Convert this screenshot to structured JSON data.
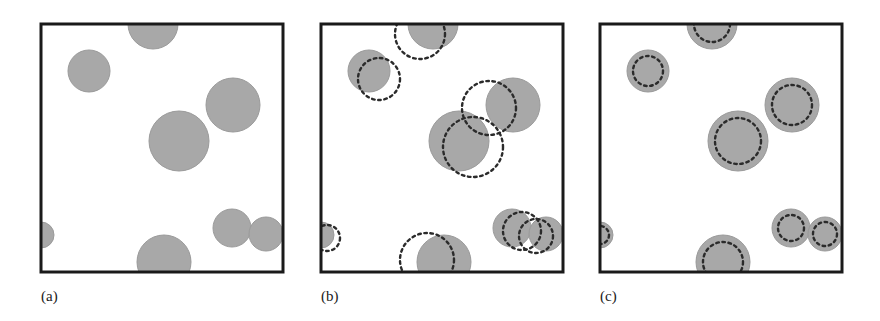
{
  "figure": {
    "width": 880,
    "height": 321,
    "background": "#ffffff",
    "panel_count": 3
  },
  "style": {
    "disk_fill": "#a8a8a8",
    "disk_stroke": "#9a9a9a",
    "box_stroke": "#1a1a1a",
    "box_stroke_width": 3,
    "dash_stroke": "#2b2b2b",
    "dash_stroke_width": 2.4,
    "dash_pattern": "2.6 3.6",
    "label_color": "#1a1a1a"
  },
  "panels": [
    {
      "id": "a",
      "label": "(a)",
      "label_x": 41,
      "label_y": 301,
      "box": {
        "x": 41,
        "y": 24,
        "w": 242,
        "h": 248
      },
      "has_dashed": false,
      "dash_mode": "none",
      "disks": [
        {
          "cx": 89,
          "cy": 71,
          "r": 21
        },
        {
          "cx": 153,
          "cy": 24,
          "r": 25
        },
        {
          "cx": 233,
          "cy": 105,
          "r": 27
        },
        {
          "cx": 179,
          "cy": 141,
          "r": 30
        },
        {
          "cx": 41,
          "cy": 235,
          "r": 13
        },
        {
          "cx": 232,
          "cy": 228,
          "r": 19
        },
        {
          "cx": 266,
          "cy": 234,
          "r": 17
        },
        {
          "cx": 164,
          "cy": 262,
          "r": 27
        }
      ]
    },
    {
      "id": "b",
      "label": "(b)",
      "label_x": 321,
      "label_y": 301,
      "box": {
        "x": 321,
        "y": 24,
        "w": 242,
        "h": 248
      },
      "has_dashed": true,
      "dash_mode": "offset",
      "disks": [
        {
          "cx": 369,
          "cy": 71,
          "r": 21,
          "dx": 10,
          "dy": 8,
          "dr": 21
        },
        {
          "cx": 433,
          "cy": 24,
          "r": 25,
          "dx": -13,
          "dy": 10,
          "dr": 25
        },
        {
          "cx": 513,
          "cy": 105,
          "r": 27,
          "dx": -24,
          "dy": 3,
          "dr": 27
        },
        {
          "cx": 459,
          "cy": 141,
          "r": 30,
          "dx": 14,
          "dy": 6,
          "dr": 30
        },
        {
          "cx": 321,
          "cy": 235,
          "r": 13,
          "dx": 6,
          "dy": 3,
          "dr": 13
        },
        {
          "cx": 512,
          "cy": 228,
          "r": 19,
          "dx": 10,
          "dy": 3,
          "dr": 19
        },
        {
          "cx": 546,
          "cy": 234,
          "r": 17,
          "dx": -10,
          "dy": 2,
          "dr": 17
        },
        {
          "cx": 444,
          "cy": 262,
          "r": 27,
          "dx": -17,
          "dy": -2,
          "dr": 27
        }
      ]
    },
    {
      "id": "c",
      "label": "(c)",
      "label_x": 600,
      "label_y": 301,
      "box": {
        "x": 600,
        "y": 24,
        "w": 242,
        "h": 248
      },
      "has_dashed": true,
      "dash_mode": "concentric",
      "disks": [
        {
          "cx": 648,
          "cy": 71,
          "r": 21,
          "dx": 0,
          "dy": 0,
          "dr": 15
        },
        {
          "cx": 712,
          "cy": 24,
          "r": 25,
          "dx": 0,
          "dy": 0,
          "dr": 18
        },
        {
          "cx": 792,
          "cy": 105,
          "r": 27,
          "dx": 0,
          "dy": 0,
          "dr": 20
        },
        {
          "cx": 738,
          "cy": 141,
          "r": 30,
          "dx": 0,
          "dy": 0,
          "dr": 23
        },
        {
          "cx": 600,
          "cy": 235,
          "r": 13,
          "dx": 0,
          "dy": 0,
          "dr": 9
        },
        {
          "cx": 791,
          "cy": 228,
          "r": 19,
          "dx": 0,
          "dy": 0,
          "dr": 13
        },
        {
          "cx": 825,
          "cy": 234,
          "r": 17,
          "dx": 0,
          "dy": 0,
          "dr": 12
        },
        {
          "cx": 723,
          "cy": 262,
          "r": 27,
          "dx": 0,
          "dy": 0,
          "dr": 20
        }
      ]
    }
  ]
}
